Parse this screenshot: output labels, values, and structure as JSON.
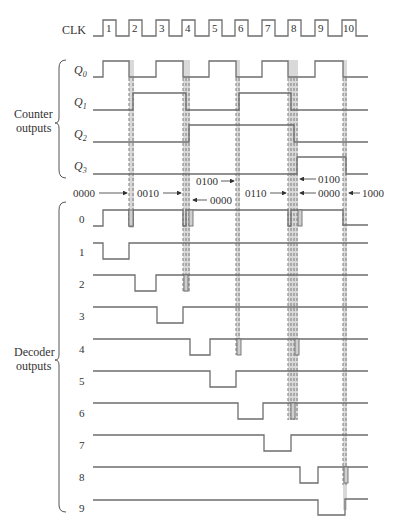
{
  "diagram": {
    "clock": {
      "label": "CLK",
      "pulses": [
        "1",
        "2",
        "3",
        "4",
        "5",
        "6",
        "7",
        "8",
        "9",
        "10"
      ]
    },
    "counter_group": {
      "label_line1": "Counter",
      "label_line2": "outputs",
      "signals": [
        {
          "label": "Q",
          "sub": "0"
        },
        {
          "label": "Q",
          "sub": "1"
        },
        {
          "label": "Q",
          "sub": "2"
        },
        {
          "label": "Q",
          "sub": "3"
        }
      ]
    },
    "glitch_states": [
      {
        "text": "0000",
        "arrow": "right"
      },
      {
        "text": "0010",
        "arrow": "right"
      },
      {
        "text": "0000",
        "arrow": "left"
      },
      {
        "text": "0100",
        "arrow": "right"
      },
      {
        "text": "0110",
        "arrow": "right"
      },
      {
        "text": "0100",
        "arrow": "left"
      },
      {
        "text": "0000",
        "arrow": "left"
      },
      {
        "text": "1000",
        "arrow": "left"
      }
    ],
    "decoder_group": {
      "label_line1": "Decoder",
      "label_line2": "outputs",
      "outputs": [
        "0",
        "1",
        "2",
        "3",
        "4",
        "5",
        "6",
        "7",
        "8",
        "9"
      ]
    }
  }
}
